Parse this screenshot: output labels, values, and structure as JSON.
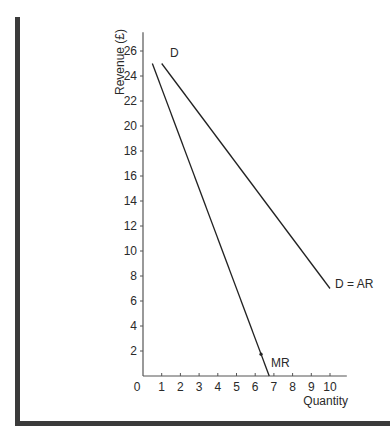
{
  "chart_data": {
    "type": "line",
    "title": "",
    "xlabel": "Quantity",
    "ylabel": "Revenue (£)",
    "xlim": [
      0,
      10.9
    ],
    "ylim": [
      0,
      27.5
    ],
    "x_ticks": [
      1,
      2,
      3,
      4,
      5,
      6,
      7,
      8,
      9,
      10
    ],
    "x_tick_labels": [
      "0",
      "1",
      "2",
      "3",
      "4",
      "5",
      "6",
      "7",
      "8",
      "9",
      "10"
    ],
    "y_ticks": [
      2,
      4,
      6,
      8,
      10,
      12,
      14,
      16,
      18,
      20,
      22,
      24,
      26
    ],
    "y_tick_labels": [
      "2",
      "4",
      "6",
      "8",
      "10",
      "12",
      "14",
      "16",
      "18",
      "20",
      "22",
      "24",
      "26"
    ],
    "grid": false,
    "legend": "none (curves labeled directly)",
    "series": [
      {
        "name": "D = AR",
        "start_label": "D",
        "end_label": "D = AR",
        "x": [
          1,
          10
        ],
        "y": [
          25,
          7
        ]
      },
      {
        "name": "MR",
        "end_label": "MR",
        "x": [
          0.5,
          6.75
        ],
        "y": [
          25,
          0
        ]
      }
    ]
  }
}
